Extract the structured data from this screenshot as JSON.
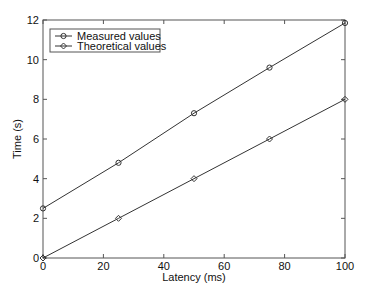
{
  "chart_data": {
    "type": "line",
    "title": "",
    "xlabel": "Latency (ms)",
    "ylabel": "Time (s)",
    "xlim": [
      0,
      100
    ],
    "ylim": [
      0,
      12
    ],
    "xticks": [
      0,
      20,
      40,
      60,
      80,
      100
    ],
    "yticks": [
      0,
      2,
      4,
      6,
      8,
      10,
      12
    ],
    "grid": false,
    "legend_position": "upper left",
    "x": [
      0,
      25,
      50,
      75,
      100
    ],
    "series": [
      {
        "name": "Measured values",
        "marker": "circle",
        "color": "#333333",
        "values": [
          2.5,
          4.8,
          7.3,
          9.6,
          11.85
        ]
      },
      {
        "name": "Theoretical values",
        "marker": "diamond",
        "color": "#333333",
        "values": [
          0,
          2,
          4,
          6,
          8
        ]
      }
    ]
  },
  "axes": {
    "x_label": "Latency (ms)",
    "y_label": "Time (s)",
    "x_tick_labels": [
      "0",
      "20",
      "40",
      "60",
      "80",
      "100"
    ],
    "y_tick_labels": [
      "0",
      "2",
      "4",
      "6",
      "8",
      "10",
      "12"
    ]
  },
  "legend": {
    "items": [
      {
        "label": "Measured values",
        "marker": "circle"
      },
      {
        "label": "Theoretical values",
        "marker": "diamond"
      }
    ]
  }
}
